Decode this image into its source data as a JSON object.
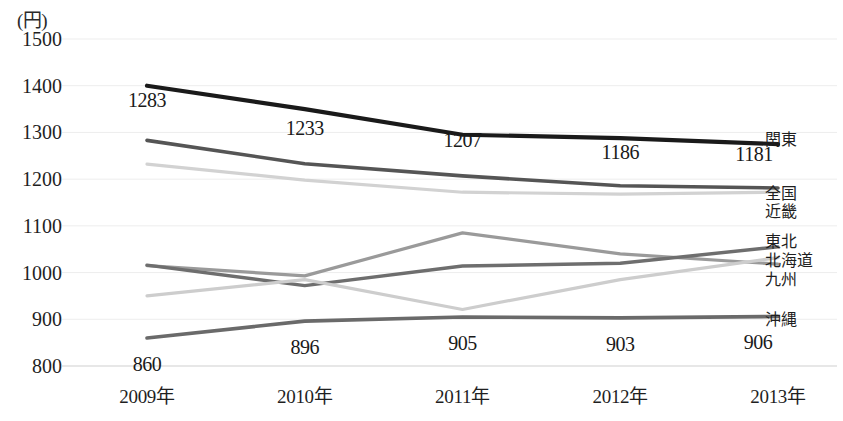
{
  "chart_data": {
    "type": "line",
    "title": "",
    "subtitle": "",
    "xlabel": "",
    "ylabel": "(円)",
    "unit_label": "(円)",
    "categories": [
      "2009年",
      "2010年",
      "2011年",
      "2012年",
      "2013年"
    ],
    "x": [
      2009,
      2010,
      2011,
      2012,
      2013
    ],
    "ylim": [
      800,
      1500
    ],
    "ytick_step": 100,
    "yticks": [
      "800",
      "900",
      "1000",
      "1100",
      "1200",
      "1300",
      "1400",
      "1500"
    ],
    "grid": true,
    "grid_axis": "y",
    "legend_position": "right-inline-at-line-end",
    "series": [
      {
        "name": "関東",
        "color": "#1a1a1a",
        "width": 4.2,
        "values": [
          1400,
          1350,
          1295,
          1288,
          1275
        ],
        "labels": []
      },
      {
        "name": "全国",
        "color": "#555555",
        "width": 3.6,
        "values": [
          1283,
          1233,
          1207,
          1186,
          1181
        ],
        "labels": [
          "1283",
          "1233",
          "1207",
          "1186",
          "1181"
        ]
      },
      {
        "name": "近畿",
        "color": "#d2d2d2",
        "width": 3.2,
        "values": [
          1232,
          1198,
          1172,
          1168,
          1172
        ],
        "labels": []
      },
      {
        "name": "東北",
        "color": "#9a9a9a",
        "width": 3.2,
        "values": [
          1015,
          993,
          1085,
          1040,
          1018
        ],
        "labels": []
      },
      {
        "name": "北海道",
        "color": "#6e6e6e",
        "width": 3.4,
        "values": [
          1016,
          972,
          1014,
          1020,
          1055
        ],
        "labels": []
      },
      {
        "name": "九州",
        "color": "#cdcdcd",
        "width": 3.2,
        "values": [
          950,
          985,
          921,
          985,
          1032
        ],
        "labels": []
      },
      {
        "name": "沖縄",
        "color": "#6a6a6a",
        "width": 3.6,
        "values": [
          860,
          896,
          905,
          903,
          906
        ],
        "labels": [
          "860",
          "896",
          "905",
          "903",
          "906"
        ]
      }
    ],
    "point_labels": [
      {
        "text": "1283",
        "x": 2009,
        "y": 1283,
        "dx": 0,
        "dy": -40
      },
      {
        "text": "1233",
        "x": 2010,
        "y": 1233,
        "dx": 0,
        "dy": -36
      },
      {
        "text": "1207",
        "x": 2011,
        "y": 1207,
        "dx": 0,
        "dy": -36
      },
      {
        "text": "1186",
        "x": 2012,
        "y": 1186,
        "dx": 0,
        "dy": -34
      },
      {
        "text": "1181",
        "x": 2013,
        "y": 1181,
        "dx": -24,
        "dy": -34
      },
      {
        "text": "860",
        "x": 2009,
        "y": 860,
        "dx": 0,
        "dy": 26
      },
      {
        "text": "896",
        "x": 2010,
        "y": 896,
        "dx": 0,
        "dy": 26
      },
      {
        "text": "905",
        "x": 2011,
        "y": 905,
        "dx": 0,
        "dy": 26
      },
      {
        "text": "903",
        "x": 2012,
        "y": 903,
        "dx": 0,
        "dy": 26
      },
      {
        "text": "906",
        "x": 2013,
        "y": 906,
        "dx": -20,
        "dy": 26
      }
    ],
    "legend_entries": [
      {
        "label": "関東",
        "y_px": 138
      },
      {
        "label": "全国",
        "y_px": 192
      },
      {
        "label": "近畿",
        "y_px": 210
      },
      {
        "label": "東北",
        "y_px": 240
      },
      {
        "label": "北海道",
        "y_px": 259
      },
      {
        "label": "九州",
        "y_px": 278
      },
      {
        "label": "沖縄",
        "y_px": 318
      }
    ]
  },
  "colors": {
    "background": "#ffffff",
    "text": "#1a1a1a",
    "gridline": "#ededed",
    "axis": "#cfcfcf"
  }
}
